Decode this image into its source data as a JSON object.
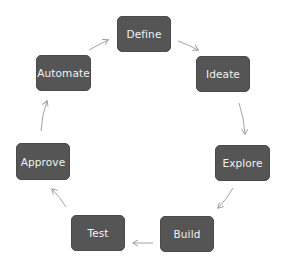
{
  "diagram": {
    "type": "cycle",
    "colors": {
      "node_fill": "#555555",
      "node_text": "#f2f2f2",
      "arrow": "#9a9a9a",
      "background": "#ffffff"
    },
    "nodes": [
      {
        "id": "define",
        "label": "Define"
      },
      {
        "id": "ideate",
        "label": "Ideate"
      },
      {
        "id": "explore",
        "label": "Explore"
      },
      {
        "id": "build",
        "label": "Build"
      },
      {
        "id": "test",
        "label": "Test"
      },
      {
        "id": "approve",
        "label": "Approve"
      },
      {
        "id": "automate",
        "label": "Automate"
      }
    ],
    "edges": [
      {
        "from": "Define",
        "to": "Ideate"
      },
      {
        "from": "Ideate",
        "to": "Explore"
      },
      {
        "from": "Explore",
        "to": "Build"
      },
      {
        "from": "Build",
        "to": "Test"
      },
      {
        "from": "Test",
        "to": "Approve"
      },
      {
        "from": "Approve",
        "to": "Automate"
      },
      {
        "from": "Automate",
        "to": "Define"
      }
    ]
  }
}
